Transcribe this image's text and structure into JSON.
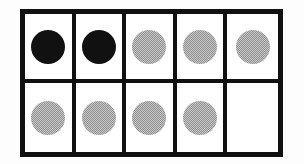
{
  "figure": {
    "kind": "ten-frame-counters",
    "rows": 2,
    "columns": 5,
    "total_cells": 10,
    "counters_total": 9,
    "counters_black": 2,
    "counters_gray": 7,
    "empty_cells": 1,
    "colors": {
      "border": "#111111",
      "cell_background": "#ffffff",
      "counter_black": "#111111",
      "counter_gray": "#a8a8a8",
      "page_background": "#fdfdfd"
    },
    "cells": [
      {
        "row": 1,
        "column": 1,
        "counter": "black",
        "label": "black-counter"
      },
      {
        "row": 1,
        "column": 2,
        "counter": "black",
        "label": "black-counter"
      },
      {
        "row": 1,
        "column": 3,
        "counter": "gray",
        "label": "gray-counter"
      },
      {
        "row": 1,
        "column": 4,
        "counter": "gray",
        "label": "gray-counter"
      },
      {
        "row": 1,
        "column": 5,
        "counter": "gray",
        "label": "gray-counter"
      },
      {
        "row": 2,
        "column": 1,
        "counter": "gray",
        "label": "gray-counter"
      },
      {
        "row": 2,
        "column": 2,
        "counter": "gray",
        "label": "gray-counter"
      },
      {
        "row": 2,
        "column": 3,
        "counter": "gray",
        "label": "gray-counter"
      },
      {
        "row": 2,
        "column": 4,
        "counter": "gray",
        "label": "gray-counter"
      },
      {
        "row": 2,
        "column": 5,
        "counter": "none",
        "label": "empty-cell"
      }
    ]
  }
}
